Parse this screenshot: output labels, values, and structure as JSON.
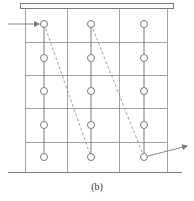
{
  "figure": {
    "caption": "(b)",
    "colors": {
      "stroke": "#7a7a7a",
      "grid": "#8a8a8a",
      "dashed": "#8a8a8a",
      "circle_fill": "#ffffff"
    },
    "top_plate": {
      "x": 20,
      "y": 3,
      "width": 153,
      "height": 5
    },
    "ground_line": {
      "x1": 8,
      "x2": 182,
      "y": 172
    },
    "grid": {
      "columns_x": [
        25,
        67,
        119,
        167
      ],
      "rows_y": [
        42,
        75,
        108,
        142
      ],
      "top_y": 8,
      "bottom_y": 172
    },
    "nodes": {
      "columns_x": [
        44,
        91,
        144
      ],
      "rows_y": [
        24,
        58,
        91,
        125,
        157
      ],
      "radius": 3.5
    },
    "dashed_paths": [
      {
        "from": [
          44,
          24
        ],
        "to": [
          91,
          157
        ]
      },
      {
        "from": [
          91,
          24
        ],
        "to": [
          144,
          157
        ]
      }
    ],
    "entry_arrow": {
      "from": [
        8,
        24
      ],
      "to": [
        39,
        24
      ]
    },
    "exit_arrow": {
      "from": [
        148,
        156
      ],
      "to": [
        187,
        146
      ]
    }
  }
}
